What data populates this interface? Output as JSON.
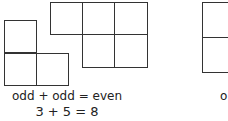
{
  "figure": {
    "panels": [
      {
        "caption_rule": "odd + odd = even",
        "caption_example": "3 + 5 = 8"
      },
      {
        "caption_partial": "o"
      }
    ],
    "line_color": "#333333"
  }
}
